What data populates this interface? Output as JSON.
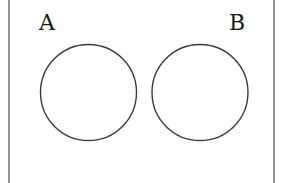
{
  "diagram": {
    "type": "venn",
    "relationship": "disjoint",
    "colors": {
      "circle_stroke": "#3a3a3a",
      "border": "#777777",
      "label": "#1a1a1a",
      "background": "#ffffff"
    },
    "sets": [
      {
        "id": "A",
        "label": "A",
        "cx": 88.5,
        "cy": 92.5,
        "r": 48,
        "label_x": 39,
        "label_y": 30
      },
      {
        "id": "B",
        "label": "B",
        "cx": 200,
        "cy": 92.5,
        "r": 48,
        "label_x": 229,
        "label_y": 30
      }
    ],
    "universe": {
      "left": 9,
      "right": 274
    }
  }
}
